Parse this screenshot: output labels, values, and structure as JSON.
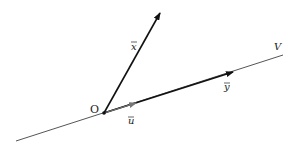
{
  "diagram": {
    "title": "",
    "line": {
      "label": "V",
      "color": "#555555"
    },
    "origin": {
      "label": "O"
    },
    "vectors": [
      {
        "id": "x",
        "label": "x̅",
        "display": "x",
        "color": "#111111"
      },
      {
        "id": "y",
        "label": "y̅",
        "display": "y",
        "color": "#111111"
      },
      {
        "id": "u",
        "label": "u̅",
        "display": "u",
        "color": "#777777"
      }
    ],
    "colors": {
      "line": "#555555",
      "vector": "#111111",
      "unit_vector": "#777777",
      "background": "#ffffff"
    }
  }
}
